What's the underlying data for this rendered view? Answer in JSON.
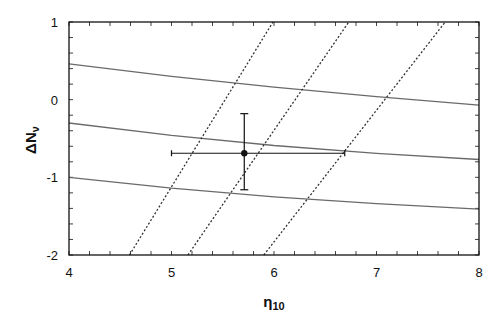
{
  "chart_data": {
    "type": "line",
    "title": "",
    "xlabel": "η10",
    "xlabel_main": "η",
    "xlabel_sub": "10",
    "ylabel": "ΔNν",
    "ylabel_main": "ΔN",
    "ylabel_sub": "ν",
    "xlim": [
      4,
      8
    ],
    "ylim": [
      -2,
      1
    ],
    "xticks": [
      4,
      5,
      6,
      7,
      8
    ],
    "yticks": [
      1,
      0,
      -1,
      -2
    ],
    "minor_tick_step": 0.2,
    "grid": false,
    "legend": null,
    "series": [
      {
        "name": "solid-upper",
        "style": "solid",
        "color": "#6a6a6a",
        "x": [
          4,
          5,
          6,
          7,
          8
        ],
        "y": [
          0.46,
          0.3,
          0.16,
          0.04,
          -0.07
        ]
      },
      {
        "name": "solid-middle",
        "style": "solid",
        "color": "#6a6a6a",
        "x": [
          4,
          5,
          6,
          7,
          8
        ],
        "y": [
          -0.3,
          -0.46,
          -0.59,
          -0.69,
          -0.77
        ]
      },
      {
        "name": "solid-lower",
        "style": "solid",
        "color": "#6a6a6a",
        "x": [
          4,
          5,
          6,
          7,
          8
        ],
        "y": [
          -1.0,
          -1.14,
          -1.25,
          -1.34,
          -1.41
        ]
      },
      {
        "name": "dashed-left",
        "style": "dashed",
        "color": "#333333",
        "x": [
          4.59,
          5.99
        ],
        "y": [
          -2,
          1
        ]
      },
      {
        "name": "dashed-middle",
        "style": "dashed",
        "color": "#333333",
        "x": [
          5.16,
          6.73
        ],
        "y": [
          -2,
          1
        ]
      },
      {
        "name": "dashed-right",
        "style": "dashed",
        "color": "#333333",
        "x": [
          5.9,
          7.67
        ],
        "y": [
          -2,
          1
        ]
      }
    ],
    "data_point": {
      "x": 5.71,
      "y": -0.69,
      "x_err": [
        5.0,
        6.69
      ],
      "y_err": [
        -1.16,
        -0.18
      ],
      "color": "#111111"
    }
  }
}
